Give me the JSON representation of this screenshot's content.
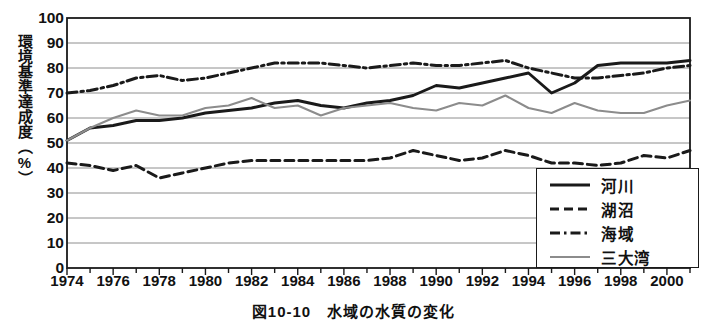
{
  "figure": {
    "caption": "図10-10　水域の水質の変化",
    "y_axis_title": "環境基準達成度（%）"
  },
  "legend": {
    "items": [
      {
        "label": "河川",
        "style": "solid-black",
        "color": "#1a1a1a"
      },
      {
        "label": "湖沼",
        "style": "dashed-black",
        "color": "#1a1a1a"
      },
      {
        "label": "海域",
        "style": "dash-dot-black",
        "color": "#1a1a1a"
      },
      {
        "label": "三大湾",
        "style": "solid-gray",
        "color": "#8c8c8c"
      }
    ]
  },
  "chart_data": {
    "type": "line",
    "title": "図10-10　水域の水質の変化",
    "xlabel": "",
    "ylabel": "環境基準達成度（%）",
    "xlim": [
      1974,
      2001
    ],
    "ylim": [
      0,
      100
    ],
    "y_ticks": [
      0,
      10,
      20,
      30,
      40,
      50,
      60,
      70,
      80,
      90,
      100
    ],
    "x_ticks": [
      1974,
      1976,
      1978,
      1980,
      1982,
      1984,
      1986,
      1988,
      1990,
      1992,
      1994,
      1996,
      1998,
      2000
    ],
    "x_tick_minor_every": 1,
    "grid": "horizontal",
    "legend_position": "bottom-right",
    "x": [
      1974,
      1975,
      1976,
      1977,
      1978,
      1979,
      1980,
      1981,
      1982,
      1983,
      1984,
      1985,
      1986,
      1987,
      1988,
      1989,
      1990,
      1991,
      1992,
      1993,
      1994,
      1995,
      1996,
      1997,
      1998,
      1999,
      2000,
      2001
    ],
    "series": [
      {
        "name": "河川",
        "style": "solid-black",
        "color": "#1a1a1a",
        "values": [
          51,
          56,
          57,
          59,
          59,
          60,
          62,
          63,
          64,
          66,
          67,
          65,
          64,
          66,
          67,
          69,
          73,
          72,
          74,
          76,
          78,
          70,
          74,
          81,
          82,
          82,
          82,
          83
        ]
      },
      {
        "name": "湖沼",
        "style": "dashed-black",
        "color": "#1a1a1a",
        "values": [
          42,
          41,
          39,
          41,
          36,
          38,
          40,
          42,
          43,
          43,
          43,
          43,
          43,
          43,
          44,
          47,
          45,
          43,
          44,
          47,
          45,
          42,
          42,
          41,
          42,
          45,
          44,
          47
        ]
      },
      {
        "name": "海域",
        "style": "dash-dot-black",
        "color": "#1a1a1a",
        "values": [
          70,
          71,
          73,
          76,
          77,
          75,
          76,
          78,
          80,
          82,
          82,
          82,
          81,
          80,
          81,
          82,
          81,
          81,
          82,
          83,
          80,
          78,
          76,
          76,
          77,
          78,
          80,
          81
        ]
      },
      {
        "name": "三大湾",
        "style": "solid-gray",
        "color": "#8c8c8c",
        "values": [
          51,
          56,
          60,
          63,
          61,
          61,
          64,
          65,
          68,
          64,
          65,
          61,
          64,
          65,
          66,
          64,
          63,
          66,
          65,
          69,
          64,
          62,
          66,
          63,
          62,
          62,
          65,
          67
        ]
      }
    ]
  }
}
